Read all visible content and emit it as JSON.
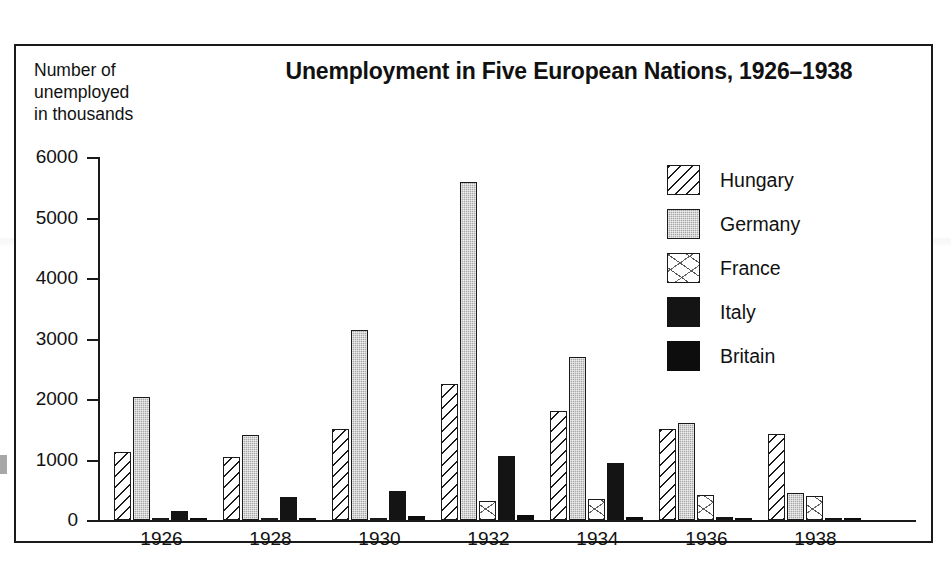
{
  "chart_data": {
    "type": "bar",
    "title": "Unemployment in Five European Nations, 1926–1938",
    "xlabel": "",
    "ylabel": "Number of\nunemployed\nin thousands",
    "ylim": [
      0,
      6000
    ],
    "y_ticks": [
      0,
      1000,
      2000,
      3000,
      4000,
      5000,
      6000
    ],
    "y_tick_labels": [
      "0",
      "1000",
      "2000",
      "3000",
      "4000",
      "5000",
      "6000"
    ],
    "grid": false,
    "legend_position": "upper right",
    "categories": [
      "1926",
      "1928",
      "1930",
      "1932",
      "1934",
      "1936",
      "1938"
    ],
    "series": [
      {
        "name": "Hungary",
        "pattern": "diagonal-hatch",
        "color": "#ffffff",
        "values": [
          1120,
          1040,
          1500,
          2250,
          1800,
          1510,
          1430
        ]
      },
      {
        "name": "Germany",
        "pattern": "gray-fill",
        "color": "#a8a8a8",
        "values": [
          2030,
          1410,
          3140,
          5580,
          2700,
          1600,
          440
        ]
      },
      {
        "name": "France",
        "pattern": "stipple",
        "color": "#ffffff",
        "values": [
          20,
          15,
          25,
          320,
          340,
          420,
          390
        ]
      },
      {
        "name": "Italy",
        "pattern": "solid-black",
        "color": "#141414",
        "values": [
          150,
          380,
          480,
          1060,
          940,
          45,
          30
        ]
      },
      {
        "name": "Britain",
        "pattern": "solid-black",
        "color": "#0d0d0d",
        "values": [
          30,
          25,
          60,
          80,
          50,
          40,
          30
        ]
      }
    ]
  },
  "legend": {
    "items": [
      {
        "label": "Hungary",
        "swatch": "diagonal-hatch-swatch"
      },
      {
        "label": "Germany",
        "swatch": "gray-fill-swatch"
      },
      {
        "label": "France",
        "swatch": "stipple-swatch"
      },
      {
        "label": "Italy",
        "swatch": "solid-black-swatch"
      },
      {
        "label": "Britain",
        "swatch": "solid-black-swatch"
      }
    ]
  }
}
